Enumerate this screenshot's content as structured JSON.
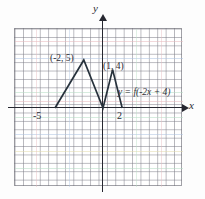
{
  "figure": {
    "axis_labels": {
      "x": "x",
      "y": "y"
    },
    "tick_labels": {
      "left_intercept": "-5",
      "right_intercept": "2"
    },
    "annotations": {
      "peak_left": "(-2, 5)",
      "peak_right": "(1, 4)",
      "equation": "y = f(-2x + 4)"
    },
    "colors": {
      "curve": "#27323c",
      "axis": "#262730",
      "grid": "#7d7d87",
      "background": "#ffffff"
    }
  },
  "chart_data": {
    "type": "line",
    "title": "",
    "xlabel": "x",
    "ylabel": "y",
    "xlim": [
      -9,
      8
    ],
    "ylim": [
      -8,
      9
    ],
    "grid": true,
    "legend": "none",
    "series": [
      {
        "name": "y = f(-2x + 4)",
        "points": [
          {
            "x": -5,
            "y": 0
          },
          {
            "x": -2,
            "y": 5
          },
          {
            "x": 0,
            "y": 0
          },
          {
            "x": 1,
            "y": 4
          },
          {
            "x": 2,
            "y": 0
          }
        ]
      }
    ],
    "annotations": [
      {
        "text": "(-2, 5)",
        "x": -2,
        "y": 5
      },
      {
        "text": "(1, 4)",
        "x": 1,
        "y": 4
      },
      {
        "text": "y = f(-2x + 4)",
        "x": 2.6,
        "y": 1.8
      },
      {
        "text": "-5",
        "x": -5,
        "y": -0.7
      },
      {
        "text": "2",
        "x": 2,
        "y": -0.7
      }
    ],
    "pixel_mapping": {
      "origin_px": [
        103,
        108
      ],
      "unit_px_x": 9.6,
      "unit_px_y": 9.6
    }
  }
}
